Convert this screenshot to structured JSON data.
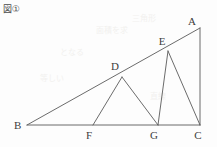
{
  "figure": {
    "label": "図①",
    "background_color": "#fdfdfd",
    "line_color": "#5a5a5a",
    "label_color": "#3d3d3d",
    "width": 217,
    "height": 147
  },
  "points": {
    "A": {
      "name": "A",
      "x": 200,
      "y": 28,
      "label_x": 196,
      "label_y": 25
    },
    "B": {
      "name": "B",
      "x": 27,
      "y": 125,
      "label_x": 14,
      "label_y": 129
    },
    "C": {
      "name": "C",
      "x": 200,
      "y": 125,
      "label_x": 198,
      "label_y": 139
    },
    "D": {
      "name": "D",
      "x": 122,
      "y": 77,
      "label_x": 115,
      "label_y": 70
    },
    "E": {
      "name": "E",
      "x": 168,
      "y": 51,
      "label_x": 162,
      "label_y": 45
    },
    "F": {
      "name": "F",
      "x": 93,
      "y": 125,
      "label_x": 89,
      "label_y": 139
    },
    "G": {
      "name": "G",
      "x": 158,
      "y": 125,
      "label_x": 154,
      "label_y": 139
    }
  },
  "segments": [
    {
      "name": "segment-BA",
      "from": "B",
      "to": "A"
    },
    {
      "name": "segment-BC",
      "from": "B",
      "to": "C"
    },
    {
      "name": "segment-AC",
      "from": "A",
      "to": "C"
    },
    {
      "name": "segment-DF",
      "from": "D",
      "to": "F"
    },
    {
      "name": "segment-DG",
      "from": "D",
      "to": "G"
    },
    {
      "name": "segment-EG",
      "from": "E",
      "to": "G"
    },
    {
      "name": "segment-EC",
      "from": "E",
      "to": "C"
    }
  ],
  "bleed_marks": [
    {
      "text": "三角形",
      "x": 132,
      "y": 18,
      "size": 8
    },
    {
      "text": "面積を求",
      "x": 96,
      "y": 30,
      "size": 8
    },
    {
      "text": "となる",
      "x": 60,
      "y": 52,
      "size": 8
    },
    {
      "text": "等しい",
      "x": 40,
      "y": 78,
      "size": 8
    },
    {
      "text": "直線",
      "x": 150,
      "y": 96,
      "size": 8
    }
  ]
}
